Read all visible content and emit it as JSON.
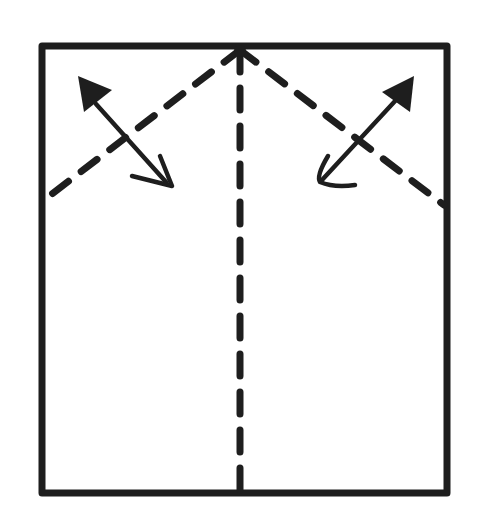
{
  "diagram": {
    "type": "origami-fold-instruction",
    "ink_color": "#1e1e1e",
    "background": "#ffffff",
    "paper": {
      "x1": 42,
      "y1": 46,
      "x2": 447,
      "y2": 493
    },
    "folds": [
      {
        "name": "center-valley-fold",
        "style": "dashed",
        "x1": 240,
        "y1": 50,
        "x2": 240,
        "y2": 490
      },
      {
        "name": "left-diagonal-valley-fold",
        "style": "dashed",
        "x1": 240,
        "y1": 50,
        "x2": 44,
        "y2": 200
      },
      {
        "name": "right-diagonal-valley-fold",
        "style": "dashed",
        "x1": 240,
        "y1": 50,
        "x2": 444,
        "y2": 205
      }
    ],
    "arrows": [
      {
        "name": "left-fold-and-unfold-arrow",
        "tail_x": 172,
        "tail_y": 186,
        "head_x": 80,
        "head_y": 80
      },
      {
        "name": "right-fold-and-unfold-arrow",
        "tail_x": 320,
        "tail_y": 182,
        "head_x": 412,
        "head_y": 78
      }
    ]
  }
}
